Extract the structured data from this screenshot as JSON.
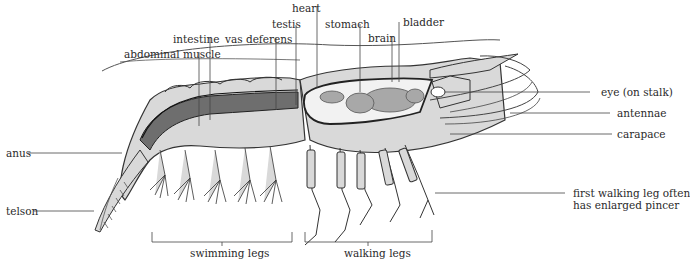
{
  "diagram": {
    "labels": {
      "heart": "heart",
      "testis": "testis",
      "stomach": "stomach",
      "bladder": "bladder",
      "intestine": "intestine",
      "vas_deferens": "vas deferens",
      "brain": "brain",
      "abdominal_muscle": "abdominal muscle",
      "eye": "eye (on stalk)",
      "antennae": "antennae",
      "carapace": "carapace",
      "anus": "anus",
      "telson": "telson",
      "first_walking_leg_line1": "first walking leg often",
      "first_walking_leg_line2": "has enlarged pincer",
      "swimming_legs": "swimming legs",
      "walking_legs": "walking legs"
    },
    "colors": {
      "body_fill": "#d9d9d9",
      "organ_fill": "#a8a8a8",
      "muscle_dark": "#6e6e6e",
      "outline": "#333333",
      "leader_line": "#444444"
    }
  }
}
